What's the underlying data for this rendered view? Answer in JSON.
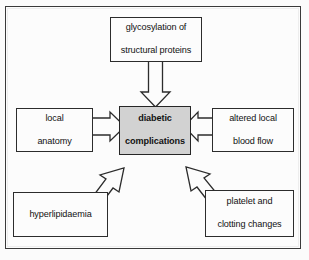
{
  "figure": {
    "frame_color": "#3a3a3a",
    "background_color": "#fcfcfc",
    "center_fill_color": "#d2d2d2",
    "outline_color": "#2c2c2c"
  },
  "nodes": {
    "center": {
      "id": "diabetic-complications",
      "line1": "diabetic",
      "line2": "complications",
      "emphasis": "bold",
      "fill": "#d2d2d2"
    },
    "top": {
      "id": "glycosylation",
      "line1": "glycosylation of",
      "line2": "structural proteins"
    },
    "left": {
      "id": "local-anatomy",
      "line1": "local",
      "line2": "anatomy"
    },
    "right": {
      "id": "altered-local-blood-flow",
      "line1": "altered local",
      "line2": "blood flow"
    },
    "bottom_left": {
      "id": "hyperlipidaemia",
      "line1": "hyperlipidaemia",
      "line2": ""
    },
    "bottom_right": {
      "id": "platelet-and-clotting-changes",
      "line1": "platelet and",
      "line2": "clotting changes"
    }
  },
  "arrows": [
    {
      "id": "arrow-top-to-center",
      "from": "glycosylation",
      "to": "diabetic-complications",
      "direction": "down",
      "style": "hollow-block"
    },
    {
      "id": "arrow-left-to-center",
      "from": "local-anatomy",
      "to": "diabetic-complications",
      "direction": "right",
      "style": "hollow-block"
    },
    {
      "id": "arrow-right-to-center",
      "from": "altered-local-blood-flow",
      "to": "diabetic-complications",
      "direction": "left",
      "style": "hollow-block"
    },
    {
      "id": "arrow-bottom-left-to-center",
      "from": "hyperlipidaemia",
      "to": "diabetic-complications",
      "direction": "up-right",
      "style": "hollow-block"
    },
    {
      "id": "arrow-bottom-right-to-center",
      "from": "platelet-and-clotting-changes",
      "to": "diabetic-complications",
      "direction": "up-left",
      "style": "hollow-block"
    }
  ]
}
